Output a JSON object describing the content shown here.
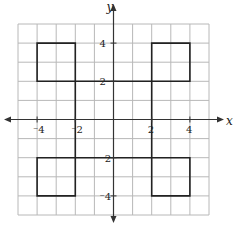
{
  "diagram": {
    "type": "coordinate-plane",
    "grid": {
      "xmin": -5,
      "xmax": 5,
      "ymin": -5,
      "ymax": 5,
      "step": 1
    },
    "axes": {
      "x_label": "x",
      "y_label": "y"
    },
    "x_ticks": [
      {
        "value": -4,
        "label": "⁻4"
      },
      {
        "value": -2,
        "label": "⁻2"
      },
      {
        "value": 2,
        "label": "2"
      },
      {
        "value": 4,
        "label": "4"
      }
    ],
    "y_ticks": [
      {
        "value": 4,
        "label": "4"
      },
      {
        "value": 2,
        "label": "2"
      },
      {
        "value": -2,
        "label": "⁻2"
      },
      {
        "value": -4,
        "label": "⁻4"
      }
    ],
    "figure": {
      "description": "Closed polygon shaped like a pinwheel: four 2x2 squares at the corners connected by a central 4x4 square outline",
      "vertices": [
        [
          -4,
          4
        ],
        [
          -2,
          4
        ],
        [
          -2,
          2
        ],
        [
          2,
          2
        ],
        [
          2,
          4
        ],
        [
          4,
          4
        ],
        [
          4,
          2
        ],
        [
          2,
          2
        ],
        [
          2,
          -2
        ],
        [
          4,
          -2
        ],
        [
          4,
          -4
        ],
        [
          2,
          -4
        ],
        [
          2,
          -2
        ],
        [
          -2,
          -2
        ],
        [
          -2,
          -4
        ],
        [
          -4,
          -4
        ],
        [
          -4,
          -2
        ],
        [
          -2,
          -2
        ],
        [
          -2,
          2
        ],
        [
          -4,
          2
        ]
      ],
      "colors": {
        "grid": "#b8b8b8",
        "axis": "#333333",
        "figure": "#222222"
      }
    }
  }
}
